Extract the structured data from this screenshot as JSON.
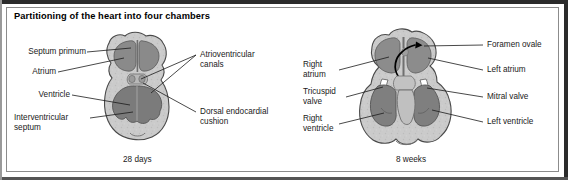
{
  "figure": {
    "title": "Partitioning of the heart into four chambers",
    "background_color": "#ffffff",
    "border_color": "#2b2b2b",
    "line_color": "#1a1a1a"
  },
  "palette": {
    "myocardium": "#c9c9c9",
    "chamber_lumen": "#8f8f8f",
    "trabeculae": "#7d7d7d",
    "cushion": "#b5b5b5",
    "outline": "#4a4a4a",
    "arrow": "#000000"
  },
  "panels": [
    {
      "id": "panel-28-days",
      "caption": "28 days",
      "labels_left": [
        {
          "id": "septum-primum",
          "text": "Septum primum"
        },
        {
          "id": "atrium",
          "text": "Atrium"
        },
        {
          "id": "ventricle",
          "text": "Ventricle"
        },
        {
          "id": "interventricular-septum",
          "text": "Interventricular\nseptum"
        }
      ],
      "labels_right": [
        {
          "id": "atrioventricular-canals",
          "text": "Atrioventricular\ncanals"
        },
        {
          "id": "dorsal-endocardial-cushion",
          "text": "Dorsal endocardial\ncushion"
        }
      ]
    },
    {
      "id": "panel-8-weeks",
      "caption": "8 weeks",
      "labels_left": [
        {
          "id": "right-atrium",
          "text": "Right\natrium"
        },
        {
          "id": "tricuspid-valve",
          "text": "Tricuspid\nvalve"
        },
        {
          "id": "right-ventricle",
          "text": "Right\nventricle"
        }
      ],
      "labels_right": [
        {
          "id": "foramen-ovale",
          "text": "Foramen ovale"
        },
        {
          "id": "left-atrium",
          "text": "Left atrium"
        },
        {
          "id": "mitral-valve",
          "text": "Mitral valve"
        },
        {
          "id": "left-ventricle",
          "text": "Left ventricle"
        }
      ]
    }
  ]
}
